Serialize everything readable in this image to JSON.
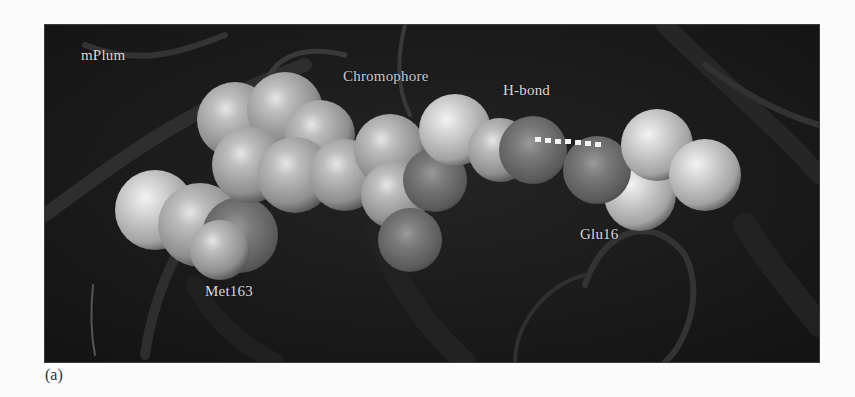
{
  "figure": {
    "panel_letter": "(a)",
    "labels": {
      "protein": "mPlum",
      "chromophore": "Chromophore",
      "hbond": "H-bond",
      "residue_glu": "Glu16",
      "residue_met": "Met163"
    },
    "colors": {
      "background": "#1b1b1b",
      "label_text": "#d9d9d9",
      "carbon_sphere": "#a9a9a9",
      "oxygen_sphere": "#6e6e6e",
      "hbond_dots": "#f2f2f2",
      "ribbon": "#2c2c2c"
    }
  }
}
